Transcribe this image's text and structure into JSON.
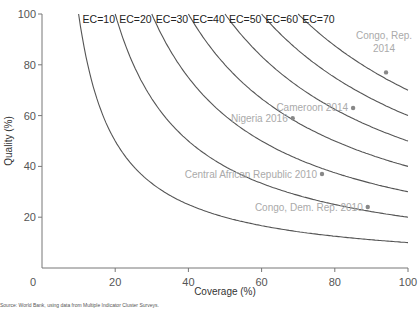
{
  "chart_data": {
    "type": "line",
    "title": "",
    "xlabel": "Coverage (%)",
    "ylabel": "Quality (%)",
    "xlim": [
      0,
      100
    ],
    "ylim": [
      0,
      100
    ],
    "x_ticks": [
      "0",
      "20",
      "40",
      "60",
      "80",
      "100"
    ],
    "y_ticks": [
      "20",
      "40",
      "60",
      "80",
      "100"
    ],
    "grid": false,
    "series": [
      {
        "name": "EC=10",
        "formula": "Quality = 100*10/Coverage",
        "ec": 10
      },
      {
        "name": "EC=20",
        "formula": "Quality = 100*20/Coverage",
        "ec": 20
      },
      {
        "name": "EC=30",
        "formula": "Quality = 100*30/Coverage",
        "ec": 30
      },
      {
        "name": "EC=40",
        "formula": "Quality = 100*40/Coverage",
        "ec": 40
      },
      {
        "name": "EC=50",
        "formula": "Quality = 100*50/Coverage",
        "ec": 50
      },
      {
        "name": "EC=60",
        "formula": "Quality = 100*60/Coverage",
        "ec": 60
      },
      {
        "name": "EC=70",
        "formula": "Quality = 100*70/Coverage",
        "ec": 70
      }
    ],
    "points": [
      {
        "label_lines": [
          "Congo, Rep.",
          "2014"
        ],
        "x": 94,
        "y": 77
      },
      {
        "label_lines": [
          "Cameroon 2014"
        ],
        "x": 85,
        "y": 63
      },
      {
        "label_lines": [
          "Nigeria 2016"
        ],
        "x": 68.5,
        "y": 59
      },
      {
        "label_lines": [
          "Central African Republic 2010"
        ],
        "x": 76.5,
        "y": 37
      },
      {
        "label_lines": [
          "Congo, Dem. Rep. 2010"
        ],
        "x": 89,
        "y": 24
      }
    ]
  },
  "source": "Source: World Bank, using data from Multiple Indicator Cluster Surveys."
}
